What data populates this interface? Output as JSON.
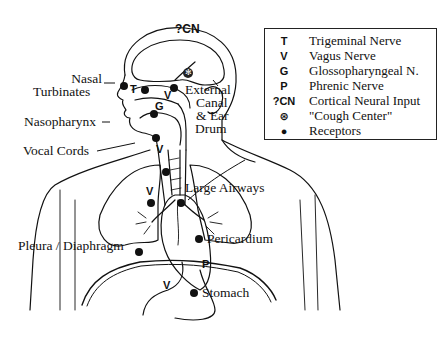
{
  "legend": {
    "items": [
      {
        "symbol": "T",
        "label": "Trigeminal Nerve"
      },
      {
        "symbol": "V",
        "label": "Vagus Nerve"
      },
      {
        "symbol": "G",
        "label": "Glossopharyngeal N."
      },
      {
        "symbol": "P",
        "label": "Phrenic Nerve"
      },
      {
        "symbol": "?CN",
        "label": "Cortical Neural Input"
      },
      {
        "symbol": "⊛",
        "label": "\"Cough Center\""
      },
      {
        "symbol": "●",
        "label": "Receptors"
      }
    ]
  },
  "labels": {
    "nasal_turbinates_1": "Nasal",
    "nasal_turbinates_2": "Turbinates",
    "nasopharynx": "Nasopharynx",
    "vocal_cords": "Vocal Cords",
    "external_canal_1": "External",
    "external_canal_2": "Canal",
    "external_canal_3": "& Ear",
    "external_canal_4": "Drum",
    "large_airways": "Large Airways",
    "pleura_diaphragm": "Pleura / Diaphragm",
    "pericardium": "Pericardium",
    "stomach": "Stomach"
  },
  "nerve_marks": {
    "cortical": "?CN",
    "trigeminal": "T",
    "glossopharyngeal": "G",
    "vagus_ear": "V",
    "vagus_larynx": "V",
    "vagus_trachea": "V",
    "vagus_lung": "V",
    "phrenic": "P",
    "vagus_stomach": "V"
  },
  "colors": {
    "line": "#111111",
    "background": "#ffffff"
  }
}
